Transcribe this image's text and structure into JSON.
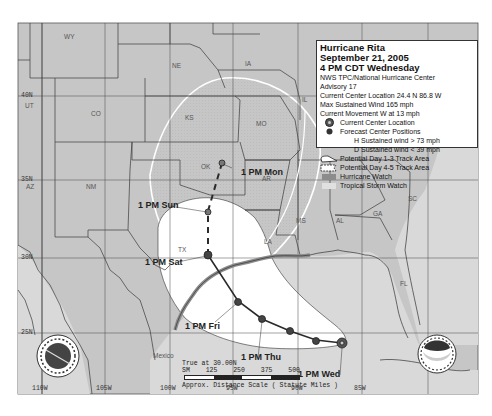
{
  "legend": {
    "title": "Hurricane Rita",
    "date": "September 21, 2005",
    "time": "4 PM CDT Wednesday",
    "agency": "NWS TPC/National Hurricane Center",
    "advisory": "Advisory 17",
    "location": "Current Center Location 24.4 N  86.8 W",
    "max_wind": "Max Sustained Wind  165 mph",
    "movement": "Current Movement W at  13 mph",
    "items": [
      {
        "icon": "current-center-icon",
        "label": "Current Center Location"
      },
      {
        "icon": "forecast-center-icon",
        "label": "Forecast Center Positions"
      },
      {
        "icon": "",
        "label": "H  Sustained wind > 73 mph"
      },
      {
        "icon": "",
        "label": "D  Sustained wind < 39 mph"
      },
      {
        "icon": "day13-cone-icon",
        "label": "Potential Day 1-3 Track Area"
      },
      {
        "icon": "day45-cone-icon",
        "label": "Potential Day 4-5 Track Area"
      },
      {
        "icon": "hurricane-watch-swatch",
        "label": "Hurricane Watch",
        "color": "#8c8c8c"
      },
      {
        "icon": "tropical-storm-watch-swatch",
        "label": "Tropical Storm Watch",
        "color": "#e0e0e0"
      }
    ]
  },
  "forecast_labels": {
    "wed": "1 PM Wed",
    "thu": "1 PM Thu",
    "fri": "1 PM Fri",
    "sat": "1 PM Sat",
    "sun": "1 PM Sun",
    "mon": "1 PM Mon"
  },
  "states": [
    "WY",
    "NE",
    "IA",
    "IL",
    "UT",
    "CO",
    "KS",
    "MO",
    "AZ",
    "NM",
    "OK",
    "AR",
    "TX",
    "LA",
    "MS",
    "AL",
    "GA",
    "SC",
    "FL"
  ],
  "country_label": "Mexico",
  "latitudes": [
    "40N",
    "35N",
    "30N",
    "25N"
  ],
  "longitudes": [
    "110W",
    "105W",
    "100W",
    "95W",
    "90W",
    "85W"
  ],
  "scale": {
    "true_at": "True at 30.00N",
    "ticks": [
      "SM",
      "125",
      "250",
      "375",
      "500"
    ],
    "caption": "Approx. Distance Scale ( Statute Miles )"
  },
  "logos": {
    "left": "nws-logo-icon",
    "right_text": "NOAA"
  },
  "colors": {
    "land": "#c4c4c4",
    "water": "#d6d6d6",
    "cone": "#ffffff",
    "track": "#333333",
    "border": "#3a3a3a"
  }
}
